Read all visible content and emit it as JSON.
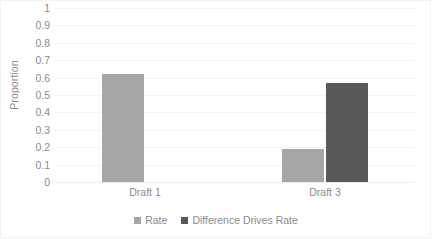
{
  "chart_data": {
    "type": "bar",
    "title": "",
    "subtitle": "",
    "xlabel": "",
    "ylabel": "Proportion",
    "categories": [
      "Draft 1",
      "Draft 3"
    ],
    "series": [
      {
        "name": "Rate",
        "color": "#a6a6a6",
        "values": [
          0.62,
          0.19
        ]
      },
      {
        "name": "Difference Drives Rate",
        "color": "#595959",
        "values": [
          0,
          0.57
        ]
      }
    ],
    "ylim": [
      0,
      1
    ],
    "ytick_step": 0.1,
    "ytick_labels": [
      "1",
      "0.9",
      "0.8",
      "0.7",
      "0.6",
      "0.5",
      "0.4",
      "0.3",
      "0.2",
      "0.1",
      "0"
    ],
    "ytick_values": [
      1,
      0.9,
      0.8,
      0.7,
      0.6,
      0.5,
      0.4,
      0.3,
      0.2,
      0.1,
      0
    ],
    "grid": "horizontal",
    "legend_position": "bottom",
    "legend_entries": [
      {
        "label": "Rate",
        "color": "#a6a6a6"
      },
      {
        "label": "Difference Drives Rate",
        "color": "#595959"
      }
    ],
    "border_color": "#f2f2f2",
    "gridline_color": "#f4f4f4",
    "text_color": "#8c8c8c"
  }
}
